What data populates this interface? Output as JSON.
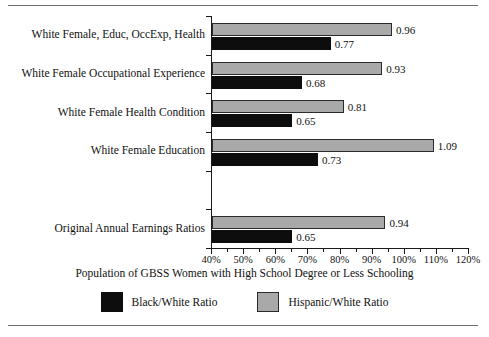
{
  "chart_data": {
    "type": "bar",
    "orientation": "horizontal",
    "title": "",
    "xlabel": "Population of GBSS Women with High School Degree or Less Schooling",
    "ylabel": "",
    "xlim": [
      40,
      120
    ],
    "xunit": "%",
    "xticks": [
      40,
      50,
      60,
      70,
      80,
      90,
      100,
      110,
      120
    ],
    "xticklabels": [
      "40%",
      "50%",
      "60%",
      "70%",
      "80%",
      "90%",
      "100%",
      "110%",
      "120%"
    ],
    "xminorticks": [
      45,
      55,
      65,
      75,
      85,
      95,
      105,
      115
    ],
    "grid": false,
    "legend_position": "bottom",
    "categories": [
      "White Female, Educ, OccExp, Health",
      "White Female Occupational Experience",
      "White Female Health Condition",
      "White Female Education",
      "",
      "Original Annual Earnings Ratios"
    ],
    "series": [
      {
        "name": "Black/White Ratio",
        "color": "#0d0d0d",
        "values": [
          0.77,
          0.68,
          0.65,
          0.73,
          null,
          0.65
        ],
        "labels": [
          "0.77",
          "0.68",
          "0.65",
          "0.73",
          "",
          "0.65"
        ]
      },
      {
        "name": "Hispanic/White Ratio",
        "color": "#a9a9a9",
        "values": [
          0.96,
          0.93,
          0.81,
          1.09,
          null,
          0.94
        ],
        "labels": [
          "0.96",
          "0.93",
          "0.81",
          "1.09",
          "",
          "0.94"
        ]
      }
    ]
  },
  "legend": {
    "items": [
      {
        "label": "Black/White Ratio",
        "swatch": "black"
      },
      {
        "label": "Hispanic/White Ratio",
        "swatch": "gray"
      }
    ]
  }
}
